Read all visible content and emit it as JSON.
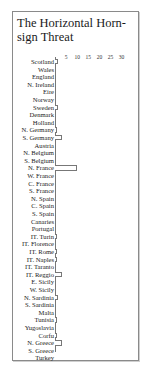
{
  "chart_data": {
    "type": "bar",
    "orientation": "horizontal",
    "title": "The Horizontal Horn-sign Threat",
    "xlabel": "",
    "ylabel": "",
    "xlim": [
      0,
      30
    ],
    "x_ticks": [
      "5",
      "10",
      "15",
      "20",
      "25",
      "30"
    ],
    "grid": false,
    "legend": null,
    "categories": [
      "Scotland",
      "Wales",
      "England",
      "N. Ireland",
      "Eire",
      "Norway",
      "Sweden",
      "Denmark",
      "Holland",
      "N. Germany",
      "S. Germany",
      "Austria",
      "N. Belgium",
      "S. Belgium",
      "N. France",
      "W. France",
      "C. France",
      "S. France",
      "N. Spain",
      "C. Spain",
      "S. Spain",
      "Canaries",
      "Portugal",
      "IT. Turin",
      "IT. Florence",
      "IT. Rome",
      "IT. Naples",
      "IT. Taranto",
      "IT. Reggio",
      "E. Sicily",
      "W. Sicily",
      "N. Sardinia",
      "S. Sardinia",
      "Malta",
      "Tunisia",
      "Yugoslavia",
      "Corfu",
      "N. Greece",
      "S. Greece",
      "Turkey"
    ],
    "values": [
      1.5,
      0,
      0,
      0,
      0,
      0,
      1.5,
      0,
      0,
      1,
      3,
      0,
      0,
      0,
      10,
      0,
      0,
      0,
      0,
      0,
      0,
      0,
      0,
      1,
      0,
      1,
      1,
      0,
      3,
      0,
      0,
      1.5,
      0,
      0,
      1,
      0,
      1,
      3,
      0,
      0
    ]
  }
}
